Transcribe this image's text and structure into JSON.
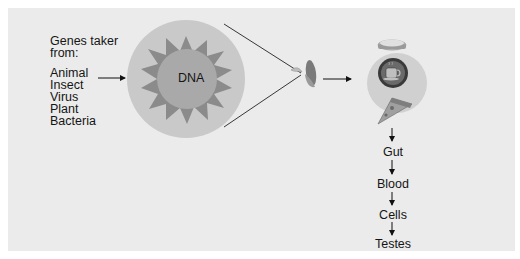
{
  "diagram": {
    "source_heading": "Genes taker from:",
    "source_heading_line1": "Genes taker",
    "source_heading_line2": "from:",
    "sources": [
      "Animal",
      "Insect",
      "Virus",
      "Plant",
      "Bacteria"
    ],
    "dna_label": "DNA",
    "crop_icon": "corn-cob-icon",
    "food_icons": [
      "sandwich-icon",
      "coffee-cup-icon",
      "pizza-slice-icon"
    ],
    "pathway": [
      "Gut",
      "Blood",
      "Cells",
      "Testes"
    ],
    "colors": {
      "panel_bg": "#ebebeb",
      "outer_circle": "#c9c9c9",
      "star": "#8b8b8b",
      "inner_circle": "#a9a9a9",
      "food_circle": "#cfcfcf",
      "arrow": "#111111"
    }
  }
}
